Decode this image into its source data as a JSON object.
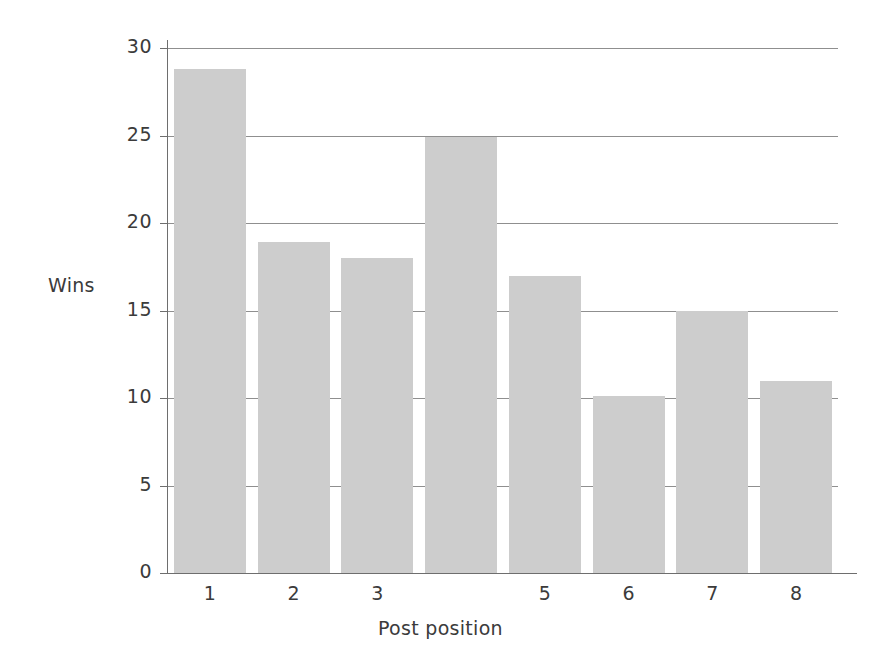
{
  "chart_data": {
    "type": "bar",
    "title": "",
    "subtitle": "",
    "xlabel": "Post position",
    "ylabel": "Wins",
    "categories": [
      "1",
      "2",
      "3",
      "",
      "5",
      "6",
      "7",
      "8"
    ],
    "values": [
      28.8,
      18.9,
      18.0,
      24.9,
      17.0,
      10.1,
      15.0,
      11.0
    ],
    "ylim": [
      0,
      30
    ],
    "ytick_labels": [
      "0",
      "5",
      "10",
      "15",
      "20",
      "25",
      "30"
    ],
    "ytick_values": [
      0,
      5,
      10,
      15,
      20,
      25,
      30
    ],
    "grid": "horizontal",
    "legend": "none",
    "bar_color": "#cdcdcd",
    "grid_color": "#8f8f8f",
    "axis_color": "#6e6e6e",
    "text_color": "#3b3b3b",
    "background": "#ffffff",
    "note": "the fourth category tick label is blank in the source figure"
  }
}
